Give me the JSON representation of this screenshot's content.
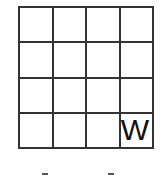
{
  "grid": {
    "rows": 4,
    "cols": 4,
    "cells": [
      [
        "",
        "",
        "",
        ""
      ],
      [
        "",
        "",
        "",
        ""
      ],
      [
        "",
        "",
        "",
        ""
      ],
      [
        "",
        "",
        "",
        "W"
      ]
    ]
  }
}
